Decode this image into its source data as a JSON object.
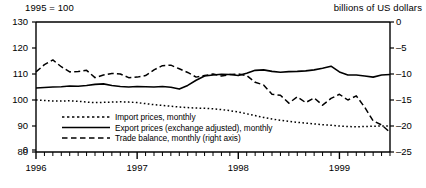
{
  "header": {
    "left_note": "1995 = 100",
    "right_note": "billions of US dollars"
  },
  "chart_data": {
    "type": "line",
    "title": "",
    "subtitle": "",
    "xlabel": "",
    "ylabel": "1995 = 100",
    "y2label": "billions of US dollars",
    "grid": false,
    "legend_position": "inside-lower-left",
    "x_tick_labels": [
      "1996",
      "1997",
      "1998",
      "1999"
    ],
    "x_tick_positions": [
      0,
      12,
      24,
      36
    ],
    "x_minor_ticks": "monthly",
    "xlim": [
      0,
      42
    ],
    "ylim": [
      80,
      130
    ],
    "y_ticks": [
      80,
      90,
      100,
      110,
      120,
      130
    ],
    "y_axis_break_label": "0",
    "y2lim": [
      -25,
      0
    ],
    "y2_ticks": [
      -25,
      -20,
      -15,
      -10,
      -5,
      0
    ],
    "series": [
      {
        "name": "Import prices, monthly",
        "label": "Import prices, monthly",
        "style": "dotted",
        "axis": "left",
        "values": [
          100.0,
          99.8,
          99.6,
          99.6,
          99.7,
          99.5,
          99.2,
          99.0,
          99.1,
          99.2,
          99.3,
          99.2,
          99.0,
          98.6,
          98.2,
          97.9,
          97.6,
          97.3,
          97.1,
          96.9,
          96.8,
          96.6,
          96.3,
          95.9,
          95.4,
          94.7,
          94.0,
          93.3,
          92.7,
          92.2,
          91.8,
          91.4,
          91.1,
          90.8,
          90.5,
          90.3,
          90.0,
          89.8,
          89.7,
          89.8,
          89.9,
          90.0,
          90.0
        ]
      },
      {
        "name": "Export prices (exchange adjusted), monthly",
        "label": "Export prices (exchange adjusted), monthly",
        "style": "solid",
        "axis": "left",
        "values": [
          104.6,
          104.8,
          105.0,
          105.1,
          105.4,
          105.3,
          105.6,
          106.0,
          106.2,
          105.6,
          105.2,
          105.0,
          105.2,
          105.1,
          105.0,
          105.2,
          104.9,
          104.2,
          105.6,
          107.6,
          109.2,
          109.6,
          109.9,
          109.8,
          109.4,
          110.3,
          111.4,
          111.6,
          111.0,
          110.7,
          110.9,
          111.0,
          111.2,
          111.6,
          112.2,
          113.0,
          110.8,
          109.6,
          109.6,
          109.2,
          108.8,
          109.6,
          109.8
        ]
      },
      {
        "name": "Trade balance, monthly (right axis)",
        "label": "Trade balance, monthly (right axis)",
        "style": "dashed",
        "axis": "right",
        "values": [
          -9.6,
          -8.2,
          -7.3,
          -8.6,
          -9.6,
          -9.5,
          -9.3,
          -10.7,
          -10.2,
          -9.9,
          -10.0,
          -10.7,
          -10.6,
          -10.3,
          -9.2,
          -8.4,
          -8.3,
          -9.0,
          -9.7,
          -10.6,
          -10.3,
          -10.0,
          -10.4,
          -10.1,
          -10.0,
          -10.3,
          -11.6,
          -12.1,
          -13.9,
          -14.1,
          -15.6,
          -14.4,
          -15.5,
          -14.6,
          -16.0,
          -14.7,
          -13.9,
          -15.0,
          -14.2,
          -16.4,
          -19.0,
          -19.8,
          -21.2
        ]
      }
    ]
  }
}
